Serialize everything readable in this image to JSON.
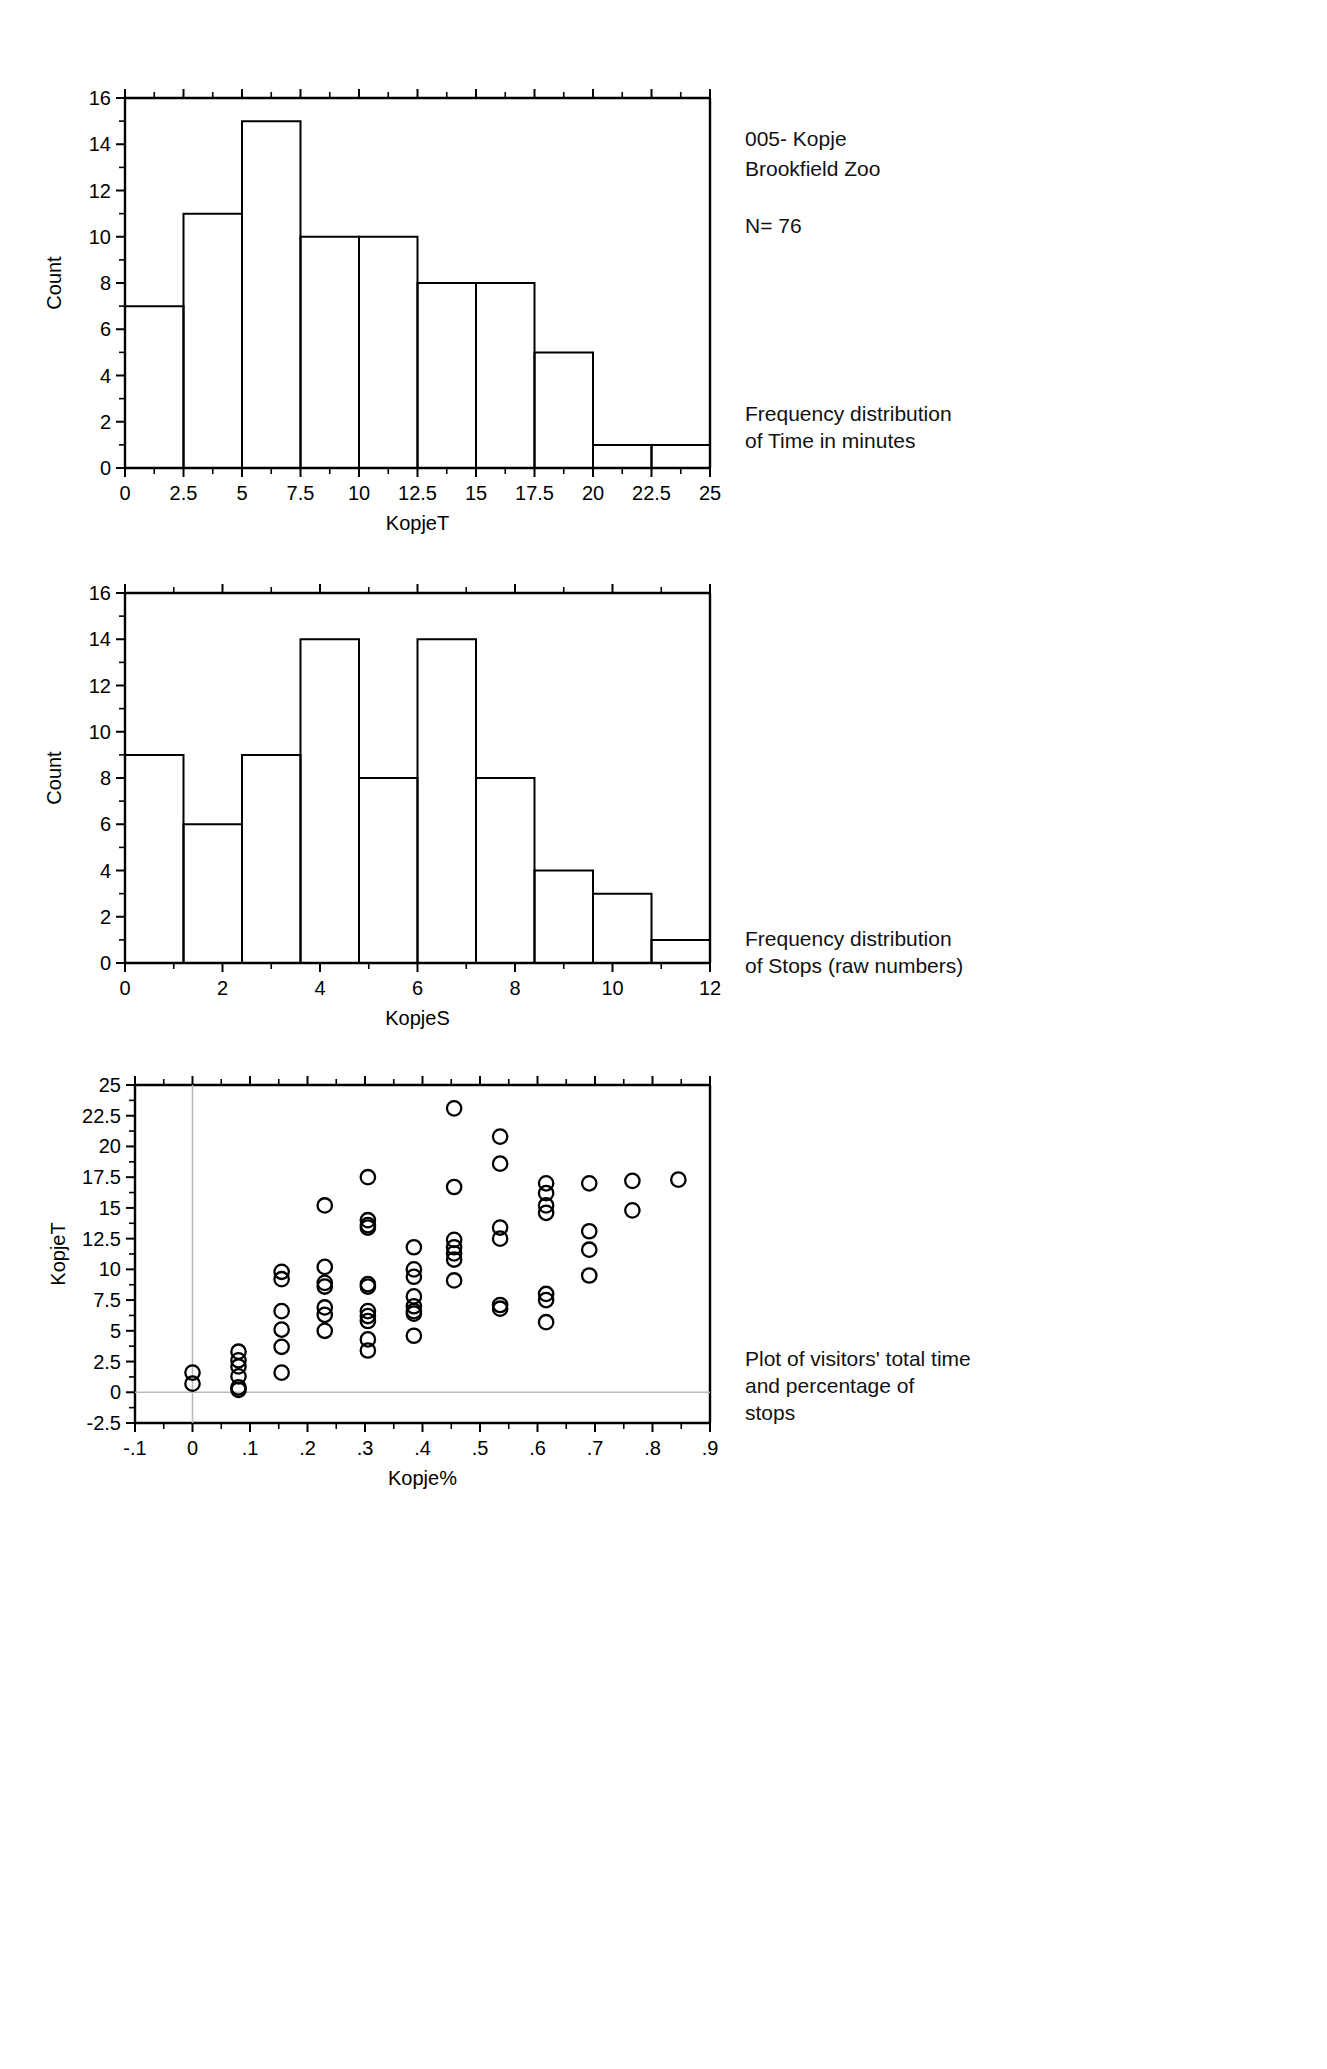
{
  "header": {
    "site_code": "005- Kopje",
    "location": "Brookfield Zoo",
    "sample_size": "N= 76"
  },
  "annotations": {
    "chart1_caption": "Frequency distribution\nof Time in minutes",
    "chart2_caption": "Frequency distribution\nof Stops (raw numbers)",
    "chart3_caption": "Plot of visitors' total time\nand percentage of\nstops"
  },
  "chart_data": [
    {
      "id": "kopjeT-histogram",
      "type": "bar",
      "title": "",
      "xlabel": "KopjeT",
      "ylabel": "Count",
      "xlim": [
        0,
        25
      ],
      "ylim": [
        0,
        16
      ],
      "xticks": [
        "0",
        "2.5",
        "5",
        "7.5",
        "10",
        "12.5",
        "15",
        "17.5",
        "20",
        "22.5",
        "25"
      ],
      "xtick_values": [
        0,
        2.5,
        5,
        7.5,
        10,
        12.5,
        15,
        17.5,
        20,
        22.5,
        25
      ],
      "yticks": [
        "0",
        "2",
        "4",
        "6",
        "8",
        "10",
        "12",
        "14",
        "16"
      ],
      "ytick_values": [
        0,
        2,
        4,
        6,
        8,
        10,
        12,
        14,
        16
      ],
      "bin_width": 2.5,
      "bin_starts": [
        0,
        2.5,
        5,
        7.5,
        10,
        12.5,
        15,
        17.5,
        20,
        22.5
      ],
      "categories": [
        "0-2.5",
        "2.5-5",
        "5-7.5",
        "7.5-10",
        "10-12.5",
        "12.5-15",
        "15-17.5",
        "17.5-20",
        "20-22.5",
        "22.5-25"
      ],
      "values": [
        7,
        11,
        15,
        10,
        10,
        8,
        8,
        5,
        1,
        1
      ],
      "grid": false,
      "legend": "none"
    },
    {
      "id": "kopjeS-histogram",
      "type": "bar",
      "title": "",
      "xlabel": "KopjeS",
      "ylabel": "Count",
      "xlim": [
        0,
        12
      ],
      "ylim": [
        0,
        16
      ],
      "xticks": [
        "0",
        "2",
        "4",
        "6",
        "8",
        "10",
        "12"
      ],
      "xtick_values": [
        0,
        2,
        4,
        6,
        8,
        10,
        12
      ],
      "yticks": [
        "0",
        "2",
        "4",
        "6",
        "8",
        "10",
        "12",
        "14",
        "16"
      ],
      "ytick_values": [
        0,
        2,
        4,
        6,
        8,
        10,
        12,
        14,
        16
      ],
      "bin_width": 1.2,
      "bin_starts": [
        0,
        1.2,
        2.4,
        3.6,
        4.8,
        6.0,
        7.2,
        8.4,
        9.6,
        10.8
      ],
      "categories": [
        "0-1.2",
        "1.2-2.4",
        "2.4-3.6",
        "3.6-4.8",
        "4.8-6.0",
        "6.0-7.2",
        "7.2-8.4",
        "8.4-9.6",
        "9.6-10.8",
        "10.8-12"
      ],
      "values": [
        9,
        6,
        9,
        14,
        8,
        14,
        8,
        4,
        3,
        1
      ],
      "grid": false,
      "legend": "none"
    },
    {
      "id": "kopje-scatter",
      "type": "scatter",
      "title": "",
      "xlabel": "Kopje%",
      "ylabel": "KopjeT",
      "xlim": [
        -0.1,
        0.9
      ],
      "ylim": [
        -2.5,
        25
      ],
      "xticks": [
        "-.1",
        "0",
        ".1",
        ".2",
        ".3",
        ".4",
        ".5",
        ".6",
        ".7",
        ".8",
        ".9"
      ],
      "xtick_values": [
        -0.1,
        0,
        0.1,
        0.2,
        0.3,
        0.4,
        0.5,
        0.6,
        0.7,
        0.8,
        0.9
      ],
      "yticks": [
        "-2.5",
        "0",
        "2.5",
        "5",
        "7.5",
        "10",
        "12.5",
        "15",
        "17.5",
        "20",
        "22.5",
        "25"
      ],
      "ytick_values": [
        -2.5,
        0,
        2.5,
        5,
        7.5,
        10,
        12.5,
        15,
        17.5,
        20,
        22.5,
        25
      ],
      "reference_lines": {
        "vertical_x": 0,
        "horizontal_y": 0
      },
      "grid": false,
      "legend": "none",
      "points": [
        [
          0.0,
          1.6
        ],
        [
          0.0,
          0.7
        ],
        [
          0.08,
          3.3
        ],
        [
          0.08,
          2.6
        ],
        [
          0.08,
          2.1
        ],
        [
          0.08,
          1.3
        ],
        [
          0.08,
          0.4
        ],
        [
          0.08,
          0.2
        ],
        [
          0.155,
          9.8
        ],
        [
          0.155,
          9.2
        ],
        [
          0.155,
          6.6
        ],
        [
          0.155,
          5.1
        ],
        [
          0.155,
          3.7
        ],
        [
          0.155,
          1.6
        ],
        [
          0.23,
          15.2
        ],
        [
          0.23,
          10.2
        ],
        [
          0.23,
          8.9
        ],
        [
          0.23,
          8.6
        ],
        [
          0.23,
          6.9
        ],
        [
          0.23,
          6.3
        ],
        [
          0.23,
          5.0
        ],
        [
          0.305,
          17.5
        ],
        [
          0.305,
          14.0
        ],
        [
          0.305,
          13.6
        ],
        [
          0.305,
          13.4
        ],
        [
          0.305,
          8.8
        ],
        [
          0.305,
          8.6
        ],
        [
          0.305,
          6.6
        ],
        [
          0.305,
          6.2
        ],
        [
          0.305,
          5.8
        ],
        [
          0.305,
          4.3
        ],
        [
          0.305,
          3.4
        ],
        [
          0.385,
          11.8
        ],
        [
          0.385,
          10.0
        ],
        [
          0.385,
          9.4
        ],
        [
          0.385,
          7.8
        ],
        [
          0.385,
          7.0
        ],
        [
          0.385,
          6.6
        ],
        [
          0.385,
          6.4
        ],
        [
          0.385,
          4.6
        ],
        [
          0.455,
          23.1
        ],
        [
          0.455,
          16.7
        ],
        [
          0.455,
          12.4
        ],
        [
          0.455,
          11.8
        ],
        [
          0.455,
          11.3
        ],
        [
          0.455,
          10.8
        ],
        [
          0.455,
          9.1
        ],
        [
          0.535,
          20.8
        ],
        [
          0.535,
          18.6
        ],
        [
          0.535,
          13.4
        ],
        [
          0.535,
          12.5
        ],
        [
          0.535,
          7.1
        ],
        [
          0.535,
          6.8
        ],
        [
          0.615,
          17.0
        ],
        [
          0.615,
          16.2
        ],
        [
          0.615,
          15.2
        ],
        [
          0.615,
          14.6
        ],
        [
          0.615,
          8.0
        ],
        [
          0.615,
          7.5
        ],
        [
          0.615,
          5.7
        ],
        [
          0.69,
          17.0
        ],
        [
          0.69,
          13.1
        ],
        [
          0.69,
          11.6
        ],
        [
          0.69,
          9.5
        ],
        [
          0.765,
          17.2
        ],
        [
          0.765,
          14.8
        ],
        [
          0.845,
          17.3
        ]
      ]
    }
  ]
}
